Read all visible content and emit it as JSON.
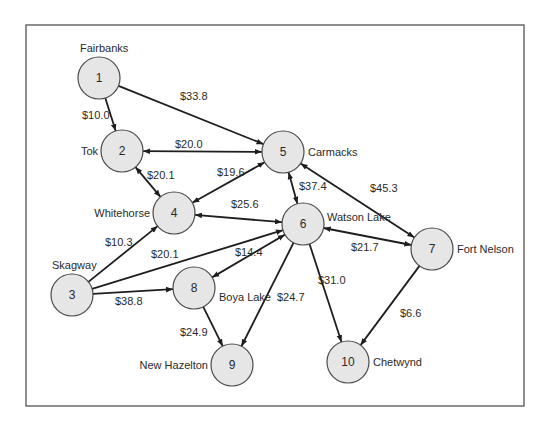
{
  "diagram": {
    "title": "",
    "type": "directed-network",
    "frame": {
      "x": 26,
      "y": 25,
      "width": 498,
      "height": 381
    },
    "colors": {
      "node_fill": "#e6e6e6",
      "node_stroke": "#4a4a4a",
      "edge": "#1e1e1e",
      "text": "#2a2a2a",
      "frame": "#6a6a6a"
    },
    "nodes": [
      {
        "id": 1,
        "num": "1",
        "name": "Fairbanks",
        "x": 99,
        "y": 78,
        "label_x": 80,
        "label_y": 52,
        "anchor": "start"
      },
      {
        "id": 2,
        "num": "2",
        "name": "Tok",
        "x": 122,
        "y": 151,
        "label_x": 98,
        "label_y": 155,
        "anchor": "end"
      },
      {
        "id": 3,
        "num": "3",
        "name": "Skagway",
        "x": 72,
        "y": 295,
        "label_x": 52,
        "label_y": 269,
        "anchor": "start"
      },
      {
        "id": 4,
        "num": "4",
        "name": "Whitehorse",
        "x": 174,
        "y": 213,
        "label_x": 150,
        "label_y": 217,
        "anchor": "end"
      },
      {
        "id": 5,
        "num": "5",
        "name": "Carmacks",
        "x": 283,
        "y": 152,
        "label_x": 308,
        "label_y": 156,
        "anchor": "start"
      },
      {
        "id": 6,
        "num": "6",
        "name": "Watson Lake",
        "x": 303,
        "y": 224,
        "label_x": 327,
        "label_y": 221,
        "anchor": "start"
      },
      {
        "id": 7,
        "num": "7",
        "name": "Fort Nelson",
        "x": 432,
        "y": 249,
        "label_x": 457,
        "label_y": 253,
        "anchor": "start"
      },
      {
        "id": 8,
        "num": "8",
        "name": "Boya Lake",
        "x": 194,
        "y": 288,
        "label_x": 219,
        "label_y": 301,
        "anchor": "start"
      },
      {
        "id": 9,
        "num": "9",
        "name": "New Hazelton",
        "x": 232,
        "y": 365,
        "label_x": 208,
        "label_y": 369,
        "anchor": "end"
      },
      {
        "id": 10,
        "num": "10",
        "name": "Chetwynd",
        "x": 348,
        "y": 362,
        "label_x": 373,
        "label_y": 366,
        "anchor": "start"
      }
    ],
    "edges": [
      {
        "from": 1,
        "to": 2,
        "cost": "$10.0",
        "bidirectional": false,
        "lx": 82,
        "ly": 119
      },
      {
        "from": 1,
        "to": 5,
        "cost": "$33.8",
        "bidirectional": false,
        "lx": 180,
        "ly": 100
      },
      {
        "from": 2,
        "to": 5,
        "cost": "$20.0",
        "bidirectional": true,
        "lx": 175,
        "ly": 148
      },
      {
        "from": 2,
        "to": 4,
        "cost": "$20.1",
        "bidirectional": true,
        "lx": 147,
        "ly": 179
      },
      {
        "from": 5,
        "to": 4,
        "cost": "$19.6",
        "bidirectional": true,
        "lx": 217,
        "ly": 176
      },
      {
        "from": 4,
        "to": 6,
        "cost": "$25.6",
        "bidirectional": true,
        "lx": 231,
        "ly": 208
      },
      {
        "from": 5,
        "to": 6,
        "cost": "$37.4",
        "bidirectional": true,
        "lx": 299,
        "ly": 190
      },
      {
        "from": 5,
        "to": 7,
        "cost": "$45.3",
        "bidirectional": true,
        "lx": 370,
        "ly": 192
      },
      {
        "from": 6,
        "to": 7,
        "cost": "$21.7",
        "bidirectional": true,
        "lx": 351,
        "ly": 251
      },
      {
        "from": 3,
        "to": 4,
        "cost": "$10.3",
        "bidirectional": false,
        "lx": 105,
        "ly": 246
      },
      {
        "from": 3,
        "to": 6,
        "cost": "$20.1",
        "bidirectional": false,
        "lx": 151,
        "ly": 258
      },
      {
        "from": 3,
        "to": 8,
        "cost": "$38.8",
        "bidirectional": false,
        "lx": 115,
        "ly": 305
      },
      {
        "from": 6,
        "to": 8,
        "cost": "$14.4",
        "bidirectional": true,
        "lx": 235,
        "ly": 256
      },
      {
        "from": 6,
        "to": 9,
        "cost": "$24.7",
        "bidirectional": false,
        "lx": 277,
        "ly": 301
      },
      {
        "from": 6,
        "to": 10,
        "cost": "$31.0",
        "bidirectional": false,
        "lx": 318,
        "ly": 284
      },
      {
        "from": 8,
        "to": 9,
        "cost": "$24.9",
        "bidirectional": false,
        "lx": 180,
        "ly": 336
      },
      {
        "from": 7,
        "to": 10,
        "cost": "$6.6",
        "bidirectional": false,
        "lx": 400,
        "ly": 317
      }
    ]
  }
}
